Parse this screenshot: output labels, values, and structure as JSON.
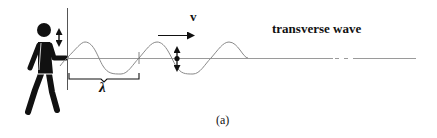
{
  "diagram": {
    "title": "transverse wave",
    "velocity_label": "v",
    "wavelength_label": "λ",
    "caption": "(a)",
    "elements": [
      {
        "name": "person",
        "description": "walking person silhouette holding end of rope"
      },
      {
        "name": "hand-oscillation-arrow",
        "description": "vertical double-headed arrow next to hand"
      },
      {
        "name": "wall-line",
        "description": "vertical reference line at rope origin"
      },
      {
        "name": "rope-axis",
        "description": "horizontal equilibrium line with dashed gap"
      },
      {
        "name": "sine-wave",
        "description": "sinusoidal wave about two and a half wavelengths"
      },
      {
        "name": "wavelength-bracket",
        "description": "bracket spanning one wavelength"
      },
      {
        "name": "velocity-arrow",
        "description": "arrow pointing right indicating propagation"
      },
      {
        "name": "particle-motion-arrow",
        "description": "dot with vertical double-headed arrow showing particle motion"
      }
    ],
    "colors": {
      "ink": "#111111",
      "wave": "#8a8a8a",
      "axis": "#9a9a9a"
    }
  }
}
